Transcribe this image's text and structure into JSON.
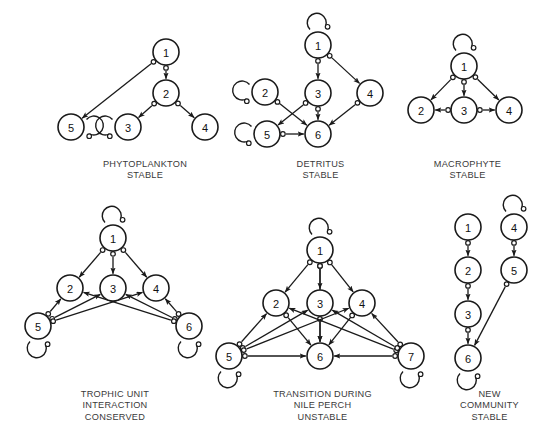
{
  "figure": {
    "background_color": "#ffffff",
    "node_fill": "#ffffff",
    "node_stroke": "#1a1a1a",
    "edge_color": "#1a1a1a",
    "caption_color": "#3a3a3a",
    "width": 553,
    "height": 445
  },
  "panels": [
    {
      "id": "phytoplankton",
      "caption": "PHYTOPLANKTON\nSTABLE",
      "caption_lines": [
        "PHYTOPLANKTON",
        "STABLE"
      ],
      "caption_x": 65,
      "caption_y": 159,
      "caption_w": 160,
      "nodes": [
        {
          "id": "1",
          "label": "1",
          "cx": 166,
          "cy": 52,
          "r": 13
        },
        {
          "id": "2",
          "label": "2",
          "cx": 166,
          "cy": 93,
          "r": 13
        },
        {
          "id": "5",
          "label": "5",
          "cx": 71,
          "cy": 127,
          "r": 13
        },
        {
          "id": "3",
          "label": "3",
          "cx": 128,
          "cy": 127,
          "r": 13
        },
        {
          "id": "4",
          "label": "4",
          "cx": 205,
          "cy": 127,
          "r": 13
        }
      ],
      "edges": [
        {
          "from": "1",
          "to": "5",
          "sign": "negative-to-positive"
        },
        {
          "from": "1",
          "to": "2",
          "sign": "negative-to-positive"
        },
        {
          "from": "2",
          "to": "3",
          "sign": "negative-to-positive"
        },
        {
          "from": "2",
          "to": "4",
          "sign": "negative-to-positive"
        }
      ],
      "self_loops": [
        {
          "node": "5",
          "side": "right"
        },
        {
          "node": "3",
          "side": "left"
        }
      ]
    },
    {
      "id": "detritus",
      "caption": "DETRITUS\nSTABLE",
      "caption_lines": [
        "DETRITUS",
        "STABLE"
      ],
      "caption_x": 258,
      "caption_y": 159,
      "caption_w": 125,
      "nodes": [
        {
          "id": "1",
          "label": "1",
          "cx": 318,
          "cy": 45,
          "r": 13
        },
        {
          "id": "2",
          "label": "2",
          "cx": 265,
          "cy": 92,
          "r": 13
        },
        {
          "id": "3",
          "label": "3",
          "cx": 318,
          "cy": 93,
          "r": 13
        },
        {
          "id": "4",
          "label": "4",
          "cx": 370,
          "cy": 93,
          "r": 13
        },
        {
          "id": "5",
          "label": "5",
          "cx": 267,
          "cy": 134,
          "r": 13
        },
        {
          "id": "6",
          "label": "6",
          "cx": 318,
          "cy": 134,
          "r": 13
        }
      ],
      "edges": [
        {
          "from": "1",
          "to": "3",
          "sign": "negative-to-positive"
        },
        {
          "from": "1",
          "to": "4",
          "sign": "negative-to-positive"
        },
        {
          "from": "2",
          "to": "6",
          "sign": "negative-to-positive"
        },
        {
          "from": "3",
          "to": "5",
          "sign": "negative-to-positive"
        },
        {
          "from": "3",
          "to": "6",
          "sign": "negative-to-positive"
        },
        {
          "from": "4",
          "to": "6",
          "sign": "negative-to-positive"
        },
        {
          "from": "5",
          "to": "6",
          "sign": "negative-to-positive"
        }
      ],
      "self_loops": [
        {
          "node": "1",
          "side": "top"
        },
        {
          "node": "2",
          "side": "left"
        },
        {
          "node": "5",
          "side": "left"
        }
      ]
    },
    {
      "id": "macrophyte",
      "caption": "MACROPHYTE\nSTABLE",
      "caption_lines": [
        "MACROPHYTE",
        "STABLE"
      ],
      "caption_x": 405,
      "caption_y": 159,
      "caption_w": 125,
      "nodes": [
        {
          "id": "1",
          "label": "1",
          "cx": 464,
          "cy": 66,
          "r": 13
        },
        {
          "id": "2",
          "label": "2",
          "cx": 421,
          "cy": 110,
          "r": 13
        },
        {
          "id": "3",
          "label": "3",
          "cx": 464,
          "cy": 110,
          "r": 13
        },
        {
          "id": "4",
          "label": "4",
          "cx": 509,
          "cy": 110,
          "r": 13
        }
      ],
      "edges": [
        {
          "from": "1",
          "to": "2",
          "sign": "negative-to-positive"
        },
        {
          "from": "1",
          "to": "3",
          "sign": "negative-to-positive"
        },
        {
          "from": "1",
          "to": "4",
          "sign": "negative-to-positive"
        },
        {
          "from": "3",
          "to": "2",
          "sign": "negative-to-positive"
        },
        {
          "from": "3",
          "to": "4",
          "sign": "negative-to-positive"
        }
      ],
      "self_loops": [
        {
          "node": "1",
          "side": "top"
        }
      ]
    },
    {
      "id": "trophic-unit",
      "caption": "TROPHIC UNIT\nINTERACTION\nCONSERVED",
      "caption_lines": [
        "TROPHIC UNIT",
        "INTERACTION",
        "CONSERVED"
      ],
      "caption_x": 45,
      "caption_y": 389,
      "caption_w": 140,
      "nodes": [
        {
          "id": "1",
          "label": "1",
          "cx": 113,
          "cy": 238,
          "r": 13
        },
        {
          "id": "2",
          "label": "2",
          "cx": 70,
          "cy": 288,
          "r": 13
        },
        {
          "id": "3",
          "label": "3",
          "cx": 113,
          "cy": 288,
          "r": 13
        },
        {
          "id": "4",
          "label": "4",
          "cx": 156,
          "cy": 288,
          "r": 13
        },
        {
          "id": "5",
          "label": "5",
          "cx": 38,
          "cy": 326,
          "r": 13
        },
        {
          "id": "6",
          "label": "6",
          "cx": 189,
          "cy": 326,
          "r": 13
        }
      ],
      "edges": [
        {
          "from": "1",
          "to": "2",
          "sign": "negative-to-positive"
        },
        {
          "from": "1",
          "to": "3",
          "sign": "negative-to-positive"
        },
        {
          "from": "1",
          "to": "4",
          "sign": "negative-to-positive"
        },
        {
          "from": "5",
          "to": "2",
          "sign": "negative-to-positive"
        },
        {
          "from": "5",
          "to": "3",
          "sign": "negative-to-positive"
        },
        {
          "from": "5",
          "to": "4",
          "sign": "negative-to-positive"
        },
        {
          "from": "6",
          "to": "4",
          "sign": "negative-to-positive"
        },
        {
          "from": "6",
          "to": "3",
          "sign": "negative-to-positive"
        },
        {
          "from": "6",
          "to": "2",
          "sign": "negative-to-positive"
        }
      ],
      "self_loops": [
        {
          "node": "1",
          "side": "top"
        },
        {
          "node": "5",
          "side": "bottom"
        },
        {
          "node": "6",
          "side": "bottom"
        }
      ]
    },
    {
      "id": "nile-perch",
      "caption": "TRANSITION DURING\nNILE PERCH\nUNSTABLE",
      "caption_lines": [
        "TRANSITION DURING",
        "NILE PERCH",
        "UNSTABLE"
      ],
      "caption_x": 240,
      "caption_y": 389,
      "caption_w": 165,
      "nodes": [
        {
          "id": "1",
          "label": "1",
          "cx": 320,
          "cy": 250,
          "r": 13
        },
        {
          "id": "2",
          "label": "2",
          "cx": 276,
          "cy": 303,
          "r": 13
        },
        {
          "id": "3",
          "label": "3",
          "cx": 320,
          "cy": 303,
          "r": 13
        },
        {
          "id": "4",
          "label": "4",
          "cx": 362,
          "cy": 303,
          "r": 13
        },
        {
          "id": "5",
          "label": "5",
          "cx": 229,
          "cy": 356,
          "r": 13
        },
        {
          "id": "6",
          "label": "6",
          "cx": 320,
          "cy": 356,
          "r": 13
        },
        {
          "id": "7",
          "label": "7",
          "cx": 411,
          "cy": 356,
          "r": 13
        }
      ],
      "edges": [
        {
          "from": "1",
          "to": "2",
          "sign": "negative-to-positive"
        },
        {
          "from": "1",
          "to": "3",
          "sign": "negative-to-positive"
        },
        {
          "from": "1",
          "to": "4",
          "sign": "negative-to-positive"
        },
        {
          "from": "1",
          "to": "6",
          "sign": "negative-to-positive"
        },
        {
          "from": "2",
          "to": "6",
          "sign": "negative-to-positive"
        },
        {
          "from": "3",
          "to": "6",
          "sign": "negative-to-positive"
        },
        {
          "from": "4",
          "to": "6",
          "sign": "negative-to-positive"
        },
        {
          "from": "5",
          "to": "2",
          "sign": "negative-to-positive"
        },
        {
          "from": "5",
          "to": "3",
          "sign": "negative-to-positive"
        },
        {
          "from": "5",
          "to": "4",
          "sign": "negative-to-positive"
        },
        {
          "from": "5",
          "to": "6",
          "sign": "negative-to-positive"
        },
        {
          "from": "7",
          "to": "2",
          "sign": "negative-to-positive"
        },
        {
          "from": "7",
          "to": "3",
          "sign": "negative-to-positive"
        },
        {
          "from": "7",
          "to": "4",
          "sign": "negative-to-positive"
        },
        {
          "from": "7",
          "to": "6",
          "sign": "negative-to-positive"
        }
      ],
      "self_loops": [
        {
          "node": "1",
          "side": "top"
        },
        {
          "node": "5",
          "side": "bottom"
        },
        {
          "node": "7",
          "side": "bottom"
        }
      ]
    },
    {
      "id": "new-community",
      "caption": "NEW\nCOMMUNITY\nSTABLE",
      "caption_lines": [
        "NEW",
        "COMMUNITY",
        "STABLE"
      ],
      "caption_x": 432,
      "caption_y": 389,
      "caption_w": 115,
      "nodes": [
        {
          "id": "1",
          "label": "1",
          "cx": 468,
          "cy": 227,
          "r": 13
        },
        {
          "id": "4",
          "label": "4",
          "cx": 514,
          "cy": 227,
          "r": 13
        },
        {
          "id": "2",
          "label": "2",
          "cx": 468,
          "cy": 270,
          "r": 13
        },
        {
          "id": "5",
          "label": "5",
          "cx": 514,
          "cy": 270,
          "r": 13
        },
        {
          "id": "3",
          "label": "3",
          "cx": 468,
          "cy": 314,
          "r": 13
        },
        {
          "id": "6",
          "label": "6",
          "cx": 468,
          "cy": 358,
          "r": 13
        }
      ],
      "edges": [
        {
          "from": "1",
          "to": "2",
          "sign": "negative-to-positive"
        },
        {
          "from": "2",
          "to": "3",
          "sign": "negative-to-positive"
        },
        {
          "from": "3",
          "to": "6",
          "sign": "negative-to-positive"
        },
        {
          "from": "4",
          "to": "5",
          "sign": "negative-to-positive"
        },
        {
          "from": "5",
          "to": "6",
          "sign": "negative-to-positive"
        }
      ],
      "self_loops": [
        {
          "node": "4",
          "side": "top"
        },
        {
          "node": "6",
          "side": "bottom"
        }
      ]
    }
  ]
}
